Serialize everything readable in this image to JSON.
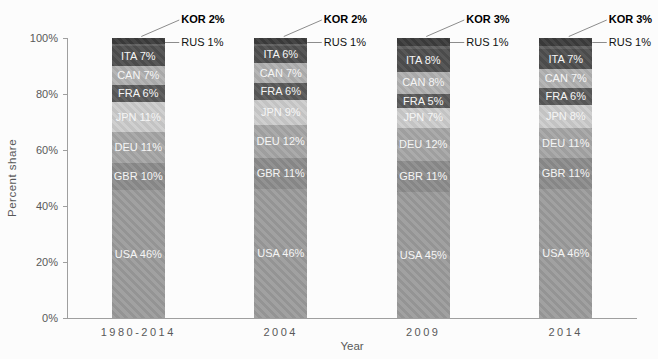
{
  "chart_data": {
    "type": "bar",
    "stacked": true,
    "title": "",
    "xlabel": "Year",
    "ylabel": "Percent share",
    "categories": [
      "1980-2014",
      "2004",
      "2009",
      "2014"
    ],
    "y_ticks": [
      "0%",
      "20%",
      "40%",
      "60%",
      "80%",
      "100%"
    ],
    "ylim": [
      0,
      100
    ],
    "grid": "off",
    "legend": "none",
    "series_bottom_to_top": [
      {
        "name": "USA",
        "color": "#9c9c9c",
        "values": [
          46,
          46,
          45,
          46
        ],
        "label_inside": true
      },
      {
        "name": "GBR",
        "color": "#8d8d8d",
        "values": [
          10,
          11,
          11,
          11
        ],
        "label_inside": true
      },
      {
        "name": "DEU",
        "color": "#a7a7a7",
        "values": [
          11,
          12,
          12,
          11
        ],
        "label_inside": true
      },
      {
        "name": "JPN",
        "color": "#cdcdcd",
        "values": [
          11,
          9,
          7,
          8
        ],
        "label_inside": true
      },
      {
        "name": "FRA",
        "color": "#5a5a5a",
        "values": [
          6,
          6,
          5,
          6
        ],
        "label_inside": true
      },
      {
        "name": "CAN",
        "color": "#b2b2b2",
        "values": [
          7,
          7,
          8,
          7
        ],
        "label_inside": true
      },
      {
        "name": "ITA",
        "color": "#4f4f4f",
        "values": [
          7,
          6,
          8,
          7
        ],
        "label_inside": true
      },
      {
        "name": "RUS",
        "color": "#616161",
        "values": [
          1,
          1,
          1,
          1
        ],
        "label_inside": false,
        "callout": true,
        "callout_bold": false
      },
      {
        "name": "KOR",
        "color": "#3c3c3c",
        "values": [
          2,
          2,
          3,
          3
        ],
        "label_inside": false,
        "callout": true,
        "callout_bold": true
      }
    ],
    "colors": {
      "background": "#fcfcfc",
      "axis": "#9f9f9f",
      "tick_label": "#595959",
      "segment_label": "#f5f5f5",
      "leader_line": "#8c8c8c",
      "callout_text": "#111111"
    }
  }
}
